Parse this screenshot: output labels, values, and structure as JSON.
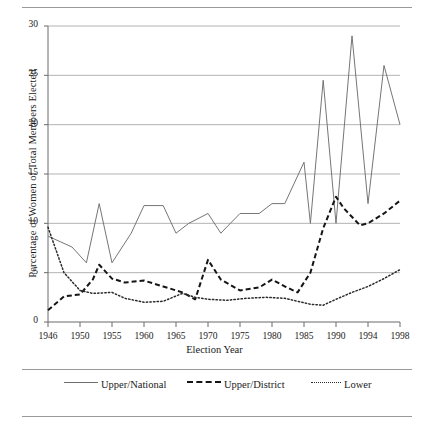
{
  "chart_data": {
    "type": "line",
    "title": "",
    "xlabel": "Election Year",
    "ylabel": "Percentage of Women of Total Members Elected",
    "xlim": [
      1946,
      1998
    ],
    "ylim": [
      0,
      30
    ],
    "yticks": [
      0,
      5,
      10,
      15,
      20,
      25,
      30
    ],
    "xticks": [
      1946,
      1950,
      1955,
      1960,
      1965,
      1970,
      1975,
      1980,
      1985,
      1990,
      1994,
      1998
    ],
    "xtick_labels": [
      "1946",
      "1950",
      "1955",
      "1960",
      "1965",
      "1970",
      "1975",
      "1980",
      "1985",
      "1990",
      "1994",
      "1998"
    ],
    "ytick_labels": [
      "0",
      "5",
      "10",
      "15",
      "20",
      "25",
      "30"
    ],
    "grid": "horizontal",
    "legend_position": "bottom",
    "series": [
      {
        "name": "Upper/National",
        "style": "solid",
        "color": "#6e6e6e",
        "points": [
          [
            1946,
            8.7
          ],
          [
            1949,
            7.6
          ],
          [
            1951,
            6.0
          ],
          [
            1953,
            12.0
          ],
          [
            1955,
            6.0
          ],
          [
            1958,
            9.0
          ],
          [
            1960,
            11.8
          ],
          [
            1963,
            11.8
          ],
          [
            1965,
            9.0
          ],
          [
            1967,
            10.0
          ],
          [
            1970,
            11.0
          ],
          [
            1972,
            9.0
          ],
          [
            1975,
            11.0
          ],
          [
            1978,
            11.0
          ],
          [
            1980,
            12.0
          ],
          [
            1982,
            12.0
          ],
          [
            1985,
            16.2
          ],
          [
            1986,
            10.0
          ],
          [
            1988,
            24.5
          ],
          [
            1990,
            10.0
          ],
          [
            1992,
            29.0
          ],
          [
            1994,
            12.0
          ],
          [
            1996,
            26.0
          ],
          [
            1998,
            20.0
          ]
        ]
      },
      {
        "name": "Upper/District",
        "style": "dashed",
        "color": "#151515",
        "points": [
          [
            1946,
            1.2
          ],
          [
            1948,
            2.6
          ],
          [
            1950,
            2.8
          ],
          [
            1952,
            4.3
          ],
          [
            1953,
            5.8
          ],
          [
            1955,
            4.4
          ],
          [
            1957,
            4.0
          ],
          [
            1960,
            4.2
          ],
          [
            1963,
            3.6
          ],
          [
            1966,
            3.0
          ],
          [
            1968,
            2.3
          ],
          [
            1970,
            6.3
          ],
          [
            1972,
            4.3
          ],
          [
            1975,
            3.2
          ],
          [
            1978,
            3.5
          ],
          [
            1980,
            4.3
          ],
          [
            1982,
            3.6
          ],
          [
            1984,
            3.0
          ],
          [
            1986,
            5.0
          ],
          [
            1988,
            9.5
          ],
          [
            1990,
            12.7
          ],
          [
            1991,
            11.5
          ],
          [
            1993,
            9.8
          ],
          [
            1994,
            10.0
          ],
          [
            1996,
            11.0
          ],
          [
            1998,
            12.3
          ]
        ]
      },
      {
        "name": "Lower",
        "style": "dotted",
        "color": "#2a2a2a",
        "points": [
          [
            1946,
            9.6
          ],
          [
            1948,
            5.0
          ],
          [
            1950,
            3.2
          ],
          [
            1952,
            2.9
          ],
          [
            1955,
            3.0
          ],
          [
            1957,
            2.4
          ],
          [
            1960,
            2.0
          ],
          [
            1963,
            2.1
          ],
          [
            1966,
            2.9
          ],
          [
            1968,
            2.5
          ],
          [
            1970,
            2.3
          ],
          [
            1973,
            2.2
          ],
          [
            1976,
            2.4
          ],
          [
            1979,
            2.5
          ],
          [
            1982,
            2.4
          ],
          [
            1984,
            2.1
          ],
          [
            1986,
            1.8
          ],
          [
            1988,
            1.7
          ],
          [
            1990,
            2.3
          ],
          [
            1992,
            3.0
          ],
          [
            1994,
            3.6
          ],
          [
            1996,
            4.4
          ],
          [
            1998,
            5.3
          ]
        ]
      }
    ]
  },
  "legend": {
    "items": [
      {
        "label": "Upper/National"
      },
      {
        "label": "Upper/District"
      },
      {
        "label": "Lower"
      }
    ]
  }
}
